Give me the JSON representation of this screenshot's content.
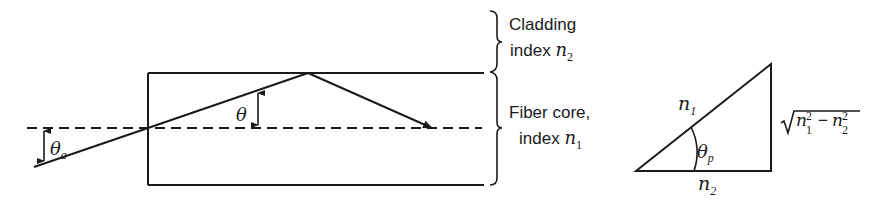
{
  "fiber_diagram": {
    "cladding_label_line1": "Cladding",
    "cladding_label_line2": "index",
    "cladding_index_symbol": "n",
    "cladding_index_sub": "2",
    "core_label_line1": "Fiber core,",
    "core_label_line2": "index",
    "core_index_symbol": "n",
    "core_index_sub": "1",
    "acceptance_angle_symbol": "θ",
    "acceptance_angle_sub": "a",
    "internal_angle_symbol": "θ"
  },
  "triangle_diagram": {
    "hypotenuse_symbol": "n",
    "hypotenuse_sub": "1",
    "base_symbol": "n",
    "base_sub": "2",
    "angle_symbol": "θ",
    "angle_sub": "p",
    "vertical_side_expr": {
      "radical": "√",
      "term1_symbol": "n",
      "term1_sub": "1",
      "term1_sup": "2",
      "operator": "−",
      "term2_symbol": "n",
      "term2_sub": "2",
      "term2_sup": "2"
    }
  }
}
